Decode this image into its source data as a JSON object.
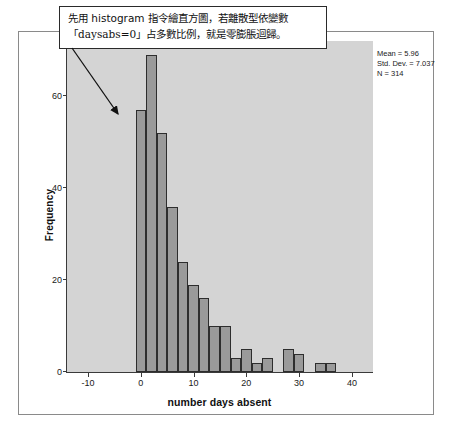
{
  "annotation": {
    "name": "histogram-guidance-note",
    "line1": "先用 histogram 指令繪直方圖，若離散型依變數",
    "line2": "「daysabs=0」占多數比例，就是零膨脹迴歸。"
  },
  "stats": {
    "mean_label": "Mean = 5.96",
    "stddev_label": "Std. Dev. = 7.037",
    "n_label": "N = 314"
  },
  "axis": {
    "y_title": "Frequency",
    "x_title": "number days absent"
  },
  "colors": {
    "plot_background": "#d4d4d4",
    "bar_fill": "#9a9a9a",
    "bar_border": "#2d2d2d",
    "axis_line": "#3a3a3a",
    "frame": "#8a8a8a",
    "annotation_border": "#2a2a2a",
    "text": "#111111"
  },
  "chart_data": {
    "type": "bar",
    "title": "",
    "subtitle": "",
    "xlabel": "number days absent",
    "ylabel": "Frequency",
    "xlim": [
      -14,
      44
    ],
    "ylim": [
      0,
      72
    ],
    "xticks": [
      -10,
      0,
      10,
      20,
      30,
      40
    ],
    "yticks": [
      0,
      20,
      40,
      60
    ],
    "grid": false,
    "legend": false,
    "bin_width": 2,
    "statistics": {
      "mean": 5.96,
      "std_dev": 7.037,
      "n": 314
    },
    "bins": [
      {
        "x_left": -1,
        "x_right": 1,
        "center": 0,
        "value": 57
      },
      {
        "x_left": 1,
        "x_right": 3,
        "center": 2,
        "value": 69
      },
      {
        "x_left": 3,
        "x_right": 5,
        "center": 4,
        "value": 52
      },
      {
        "x_left": 5,
        "x_right": 7,
        "center": 6,
        "value": 36
      },
      {
        "x_left": 7,
        "x_right": 9,
        "center": 8,
        "value": 24
      },
      {
        "x_left": 9,
        "x_right": 11,
        "center": 10,
        "value": 19
      },
      {
        "x_left": 11,
        "x_right": 13,
        "center": 12,
        "value": 16
      },
      {
        "x_left": 13,
        "x_right": 15,
        "center": 14,
        "value": 10
      },
      {
        "x_left": 15,
        "x_right": 17,
        "center": 16,
        "value": 10
      },
      {
        "x_left": 17,
        "x_right": 19,
        "center": 18,
        "value": 3
      },
      {
        "x_left": 19,
        "x_right": 21,
        "center": 20,
        "value": 5
      },
      {
        "x_left": 21,
        "x_right": 23,
        "center": 22,
        "value": 2
      },
      {
        "x_left": 23,
        "x_right": 25,
        "center": 24,
        "value": 3
      },
      {
        "x_left": 27,
        "x_right": 29,
        "center": 28,
        "value": 5
      },
      {
        "x_left": 29,
        "x_right": 31,
        "center": 30,
        "value": 4
      },
      {
        "x_left": 33,
        "x_right": 35,
        "center": 34,
        "value": 2
      },
      {
        "x_left": 35,
        "x_right": 37,
        "center": 36,
        "value": 2
      }
    ]
  }
}
